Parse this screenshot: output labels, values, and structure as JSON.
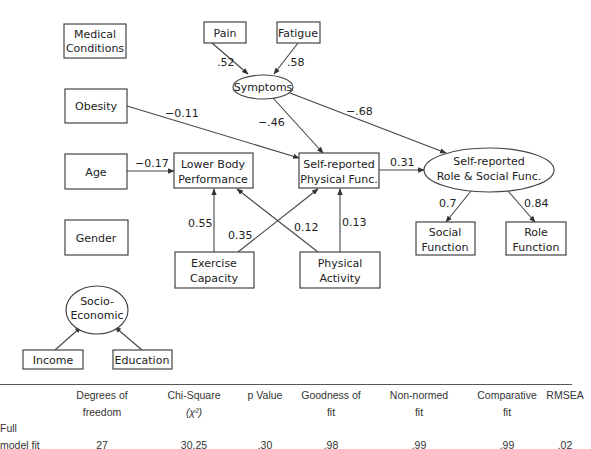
{
  "diagram": {
    "nodes": {
      "medical_conditions": {
        "line1": "Medical",
        "line2": "Conditions"
      },
      "pain": {
        "label": "Pain"
      },
      "fatigue": {
        "label": "Fatigue"
      },
      "symptoms": {
        "label": "Symptoms"
      },
      "obesity": {
        "label": "Obesity"
      },
      "age": {
        "label": "Age"
      },
      "lower_body": {
        "line1": "Lower Body",
        "line2": "Performance"
      },
      "self_physical": {
        "line1": "Self-reported",
        "line2": "Physical Func."
      },
      "self_role_social": {
        "line1": "Self-reported",
        "line2": "Role & Social Func."
      },
      "gender": {
        "label": "Gender"
      },
      "exercise_capacity": {
        "line1": "Exercise",
        "line2": "Capacity"
      },
      "physical_activity": {
        "line1": "Physical",
        "line2": "Activity"
      },
      "social_function": {
        "line1": "Social",
        "line2": "Function"
      },
      "role_function": {
        "line1": "Role",
        "line2": "Function"
      },
      "socio_economic": {
        "line1": "Socio-",
        "line2": "Economic"
      },
      "income": {
        "label": "Income"
      },
      "education": {
        "label": "Education"
      }
    },
    "coefficients": {
      "pain_symptoms": ".52",
      "fatigue_symptoms": ".58",
      "obesity_physical": "−0.11",
      "symptoms_physical": "−.46",
      "symptoms_role": "−.68",
      "age_lower": "−0.17",
      "physical_role": "0.31",
      "exercise_lower": "0.55",
      "exercise_physical": "0.35",
      "activity_lower": "0.12",
      "activity_physical": "0.13",
      "role_social": "0.7",
      "role_rolefunc": "0.84"
    }
  },
  "fit_table": {
    "headers": [
      {
        "line1": "",
        "line2": ""
      },
      {
        "line1": "Degrees of",
        "line2": "freedom"
      },
      {
        "line1": "Chi-Square",
        "line2": "(χ²)"
      },
      {
        "line1": "p Value",
        "line2": ""
      },
      {
        "line1": "Goodness of",
        "line2": "fit"
      },
      {
        "line1": "Non-normed",
        "line2": "fit"
      },
      {
        "line1": "Comparative",
        "line2": "fit"
      },
      {
        "line1": "RMSEA",
        "line2": ""
      }
    ],
    "row": {
      "label_line1": "Full",
      "label_line2": "model fit",
      "values": [
        "27",
        "30.25",
        ".30",
        ".98",
        ".99",
        ".99",
        ".02"
      ]
    }
  }
}
